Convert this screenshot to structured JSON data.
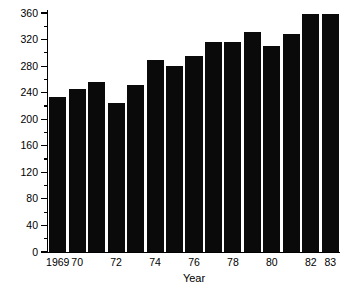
{
  "chart_data": {
    "type": "bar",
    "title": "",
    "xlabel": "Year",
    "ylabel": "Nitrate + Nitrite (µg/l)",
    "ylim": [
      0,
      360
    ],
    "ytick_step": 40,
    "yminor_step": 20,
    "grid": false,
    "legend": null,
    "bar_color": "#0a0a0a",
    "background_color": "#ffffff",
    "axis_color": "#000000",
    "categories": [
      "1969",
      "1970",
      "1971",
      "1972",
      "1973",
      "1974",
      "1975",
      "1976",
      "1977",
      "1978",
      "1979",
      "1980",
      "1981",
      "1982",
      "1983"
    ],
    "x_tick_labels_visible": [
      "1969",
      "70",
      "",
      "72",
      "",
      "74",
      "",
      "76",
      "",
      "78",
      "",
      "80",
      "",
      "82",
      "83"
    ],
    "y_tick_labels": [
      "0",
      "40",
      "80",
      "120",
      "160",
      "200",
      "240",
      "280",
      "320",
      "360"
    ],
    "y_tick_values": [
      0,
      40,
      80,
      120,
      160,
      200,
      240,
      280,
      320,
      360
    ],
    "y_minor_tick_values": [
      20,
      60,
      100,
      140,
      180,
      220,
      260,
      300,
      340
    ],
    "values": [
      234,
      246,
      256,
      225,
      252,
      289,
      280,
      296,
      316,
      316,
      332,
      311,
      328,
      358,
      358
    ],
    "series": [
      {
        "name": "Nitrate + Nitrite",
        "values": [
          234,
          246,
          256,
          225,
          252,
          289,
          280,
          296,
          316,
          316,
          332,
          311,
          328,
          358,
          358
        ]
      }
    ]
  }
}
